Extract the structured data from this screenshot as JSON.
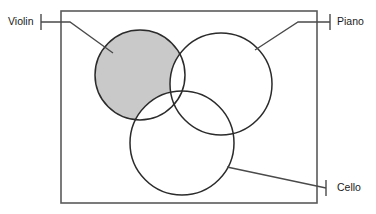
{
  "diagram": {
    "type": "venn-three-set",
    "title": "",
    "universe": {
      "name": "universal-set-rectangle",
      "x": 61,
      "y": 11,
      "width": 256,
      "height": 192,
      "stroke_color": "#5a5a5a",
      "fill_color": "#ffffff"
    },
    "sets": [
      {
        "id": "violin",
        "label": "Violin",
        "cx": 140,
        "cy": 75,
        "r": 45,
        "stroke_color": "#2b2b2b",
        "shaded": true,
        "shade_color": "#c9c9c9",
        "label_side": "left"
      },
      {
        "id": "piano",
        "label": "Piano",
        "cx": 221,
        "cy": 84,
        "r": 51,
        "stroke_color": "#2b2b2b",
        "shaded": false,
        "shade_color": "",
        "label_side": "right"
      },
      {
        "id": "cello",
        "label": "Cello",
        "cx": 182,
        "cy": 143,
        "r": 52,
        "stroke_color": "#2b2b2b",
        "shaded": false,
        "shade_color": "",
        "label_side": "right"
      }
    ],
    "shaded_region": {
      "description": "Violin only (Violin minus Piano minus Cello)",
      "color": "#c9c9c9"
    },
    "leaders": [
      {
        "id": "violin-leader",
        "label": "Violin",
        "label_x": 8,
        "label_y": 22,
        "tick_x": 41,
        "tick_y1": 14,
        "tick_y2": 30,
        "path": "M 41 22 L 70 22 L 113 53",
        "stroke_color": "#4a4a4a"
      },
      {
        "id": "piano-leader",
        "label": "Piano",
        "label_x": 337,
        "label_y": 22,
        "tick_x": 330,
        "tick_y1": 14,
        "tick_y2": 30,
        "path": "M 330 22 L 298 22 L 255 50",
        "stroke_color": "#4a4a4a"
      },
      {
        "id": "cello-leader",
        "label": "Cello",
        "label_x": 337,
        "label_y": 188,
        "tick_x": 326,
        "tick_y1": 180,
        "tick_y2": 196,
        "path": "M 326 188 L 227 167",
        "stroke_color": "#4a4a4a"
      }
    ]
  }
}
